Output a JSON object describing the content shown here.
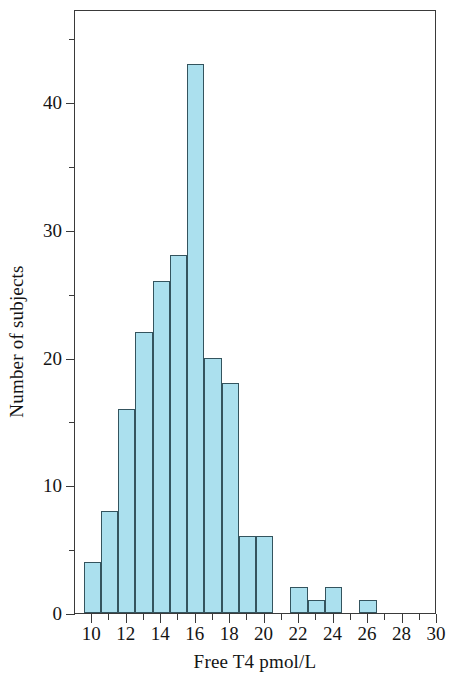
{
  "chart_data": {
    "type": "bar",
    "title": "",
    "subtitle": "",
    "xlabel": "Free T4 pmol/L",
    "ylabel": "Number of subjects",
    "xlim": [
      9.0,
      30.0
    ],
    "ylim": [
      0,
      47.3
    ],
    "grid": false,
    "legend": null,
    "bin_width": 1,
    "bar_color": "#ABE0EE",
    "bar_edge_color": "#34545e",
    "axis_color": "#3a3a3a",
    "bins": [
      {
        "label": "9.5-10.5",
        "left": 9.5,
        "right": 10.5,
        "center": 10,
        "value": 4
      },
      {
        "label": "10.5-11.5",
        "left": 10.5,
        "right": 11.5,
        "center": 11,
        "value": 8
      },
      {
        "label": "11.5-12.5",
        "left": 11.5,
        "right": 12.5,
        "center": 12,
        "value": 16
      },
      {
        "label": "12.5-13.5",
        "left": 12.5,
        "right": 13.5,
        "center": 13,
        "value": 22
      },
      {
        "label": "13.5-14.5",
        "left": 13.5,
        "right": 14.5,
        "center": 14,
        "value": 26
      },
      {
        "label": "14.5-15.5",
        "left": 14.5,
        "right": 15.5,
        "center": 15,
        "value": 28
      },
      {
        "label": "15.5-16.5",
        "left": 15.5,
        "right": 16.5,
        "center": 16,
        "value": 43
      },
      {
        "label": "16.5-17.5",
        "left": 16.5,
        "right": 17.5,
        "center": 17,
        "value": 20
      },
      {
        "label": "17.5-18.5",
        "left": 17.5,
        "right": 18.5,
        "center": 18,
        "value": 18
      },
      {
        "label": "18.5-19.5",
        "left": 18.5,
        "right": 19.5,
        "center": 19,
        "value": 6
      },
      {
        "label": "19.5-20.5",
        "left": 19.5,
        "right": 20.5,
        "center": 20,
        "value": 6
      },
      {
        "label": "20.5-21.5",
        "left": 20.5,
        "right": 21.5,
        "center": 21,
        "value": 0
      },
      {
        "label": "21.5-22.5",
        "left": 21.5,
        "right": 22.5,
        "center": 22,
        "value": 2
      },
      {
        "label": "22.5-23.5",
        "left": 22.5,
        "right": 23.5,
        "center": 23,
        "value": 1
      },
      {
        "label": "23.5-24.5",
        "left": 23.5,
        "right": 24.5,
        "center": 24,
        "value": 2
      },
      {
        "label": "24.5-25.5",
        "left": 24.5,
        "right": 25.5,
        "center": 25,
        "value": 0
      },
      {
        "label": "25.5-26.5",
        "left": 25.5,
        "right": 26.5,
        "center": 26,
        "value": 1
      },
      {
        "label": "26.5-27.5",
        "left": 26.5,
        "right": 27.5,
        "center": 27,
        "value": 0
      },
      {
        "label": "27.5-28.5",
        "left": 27.5,
        "right": 28.5,
        "center": 28,
        "value": 0
      },
      {
        "label": "28.5-29.5",
        "left": 28.5,
        "right": 29.5,
        "center": 29,
        "value": 0
      }
    ],
    "categories": [
      10,
      11,
      12,
      13,
      14,
      15,
      16,
      17,
      18,
      19,
      20,
      21,
      22,
      23,
      24,
      25,
      26,
      27,
      28,
      29
    ],
    "values": [
      4,
      8,
      16,
      22,
      26,
      28,
      43,
      20,
      18,
      6,
      6,
      0,
      2,
      1,
      2,
      0,
      1,
      0,
      0,
      0
    ],
    "xticks": [
      10,
      12,
      14,
      16,
      18,
      20,
      22,
      24,
      26,
      28,
      30
    ],
    "xticks_minor": [
      11,
      13,
      15,
      17,
      19,
      21,
      23,
      25,
      27,
      29
    ],
    "yticks": [
      0,
      10,
      20,
      30,
      40
    ],
    "yticks_minor": [
      5,
      15,
      25,
      35,
      45
    ]
  }
}
